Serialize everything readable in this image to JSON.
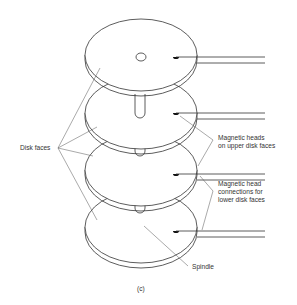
{
  "figure": {
    "caption": "(c)"
  },
  "labels": {
    "disk_faces": "Disk faces",
    "heads_upper_line1": "Magnetic heads",
    "heads_upper_line2": "on upper disk faces",
    "heads_lower_line1": "Magnetic head",
    "heads_lower_line2": "connections for",
    "heads_lower_line3": "lower disk faces",
    "spindle": "Spindle"
  },
  "diagram": {
    "disk_count": 4,
    "disks": [
      {
        "index": 1,
        "center_y": 55,
        "has_center_hole": true,
        "has_head": true
      },
      {
        "index": 2,
        "center_y": 113,
        "has_center_hole": false,
        "has_head": true
      },
      {
        "index": 3,
        "center_y": 170,
        "has_center_hole": false,
        "has_head": true
      },
      {
        "index": 4,
        "center_y": 227,
        "has_center_hole": false,
        "has_head": true
      }
    ],
    "colors": {
      "stroke": "#333333",
      "background": "#ffffff",
      "text": "#333333"
    }
  }
}
